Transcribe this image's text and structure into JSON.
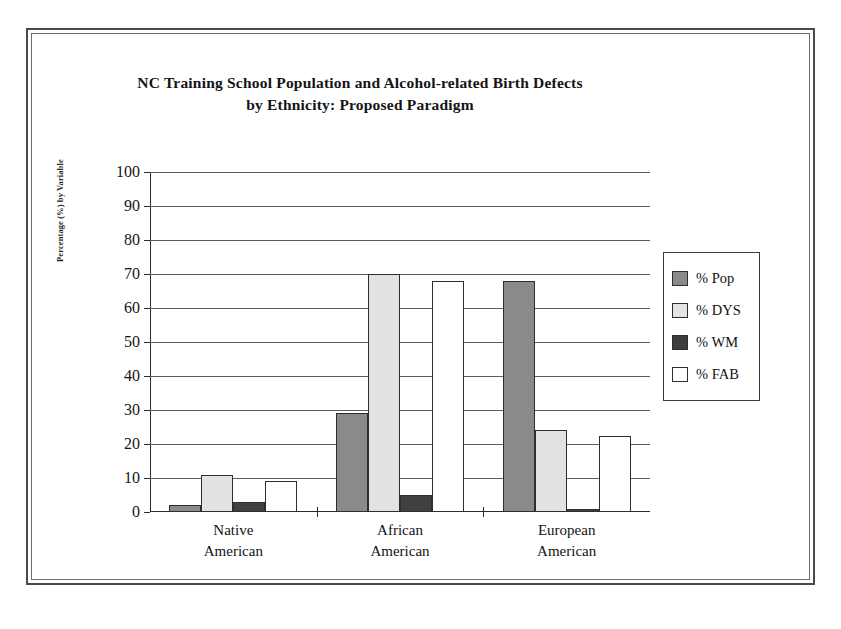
{
  "chart_data": {
    "type": "bar",
    "title": "NC Training School Population and Alcohol-related Birth Defects by Ethnicity: Proposed Paradigm",
    "title_line1": "NC Training School Population and Alcohol-related Birth Defects",
    "title_line2": "by Ethnicity:  Proposed Paradigm",
    "xlabel": "",
    "ylabel": "Percentage (%) by Variable",
    "ylim": [
      0,
      100
    ],
    "ytick_step": 10,
    "yticks": [
      0,
      10,
      20,
      30,
      40,
      50,
      60,
      70,
      80,
      90,
      100
    ],
    "grid": "horizontal",
    "legend_position": "right",
    "categories": [
      "Native American",
      "African American",
      "European American"
    ],
    "category_lines": [
      {
        "l1": "Native",
        "l2": "American"
      },
      {
        "l1": "African",
        "l2": "American"
      },
      {
        "l1": "European",
        "l2": "American"
      }
    ],
    "series": [
      {
        "name": "% Pop",
        "key": "pop",
        "color": "#8a8a8a",
        "values": [
          2,
          29,
          68
        ]
      },
      {
        "name": "% DYS",
        "key": "dys",
        "color": "#e2e2e2",
        "values": [
          11,
          70,
          24
        ]
      },
      {
        "name": "% WM",
        "key": "wm",
        "color": "#414141",
        "values": [
          3,
          5,
          1
        ]
      },
      {
        "name": "% FAB",
        "key": "fab",
        "color": "#ffffff",
        "values": [
          9,
          68,
          22.5
        ]
      }
    ]
  },
  "legend": {
    "items": [
      {
        "label": "%  Pop",
        "swatch": "pop"
      },
      {
        "label": "% DYS",
        "swatch": "dys"
      },
      {
        "label": "% WM",
        "swatch": "wm"
      },
      {
        "label": "% FAB",
        "swatch": "fab"
      }
    ]
  },
  "axis": {
    "y_title": "Percentage (%) by Variable"
  }
}
